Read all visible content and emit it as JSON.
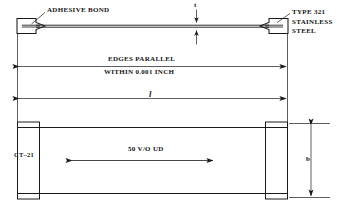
{
  "figure": {
    "type": "engineering-drawing",
    "background_color": "#ffffff",
    "line_color": "#1a1a1a",
    "text_color": "#141414"
  },
  "annotations": {
    "adhesive_bond": "ADHESIVE BOND",
    "material_line1": "TYPE 321",
    "material_line2": "STAINLESS",
    "material_line3": "STEEL",
    "thickness_symbol": "t",
    "width_symbol": "b",
    "length_symbol": "l",
    "tolerance_line1": "EDGES PARALLEL",
    "tolerance_line2": "WITHIN 0.001 INCH",
    "specimen_id": "CT–21",
    "fiber_content": "50 V/O UD"
  },
  "views": {
    "edge_view": {
      "name": "edge view",
      "left_tab_label": "ADHESIVE BOND",
      "right_tab_label": "TYPE 321 STAINLESS STEEL",
      "thickness_dim": "t"
    },
    "plan_view": {
      "name": "plan view",
      "left_label": "CT–21",
      "center_label": "50 V/O UD",
      "width_dim": "b"
    }
  },
  "dimensions": [
    {
      "name": "tolerance-note",
      "label": "EDGES PARALLEL WITHIN 0.001 INCH",
      "orientation": "horizontal"
    },
    {
      "name": "gauge-length",
      "label": "l",
      "orientation": "horizontal"
    },
    {
      "name": "specimen-thickness",
      "label": "t",
      "orientation": "vertical"
    },
    {
      "name": "specimen-width",
      "label": "b",
      "orientation": "vertical"
    }
  ]
}
